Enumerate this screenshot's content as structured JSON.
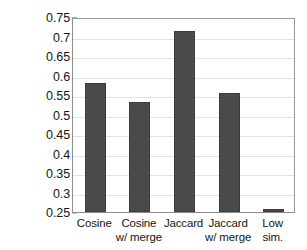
{
  "chart_data": {
    "type": "bar",
    "title": "",
    "xlabel": "",
    "ylabel": "Probability",
    "categories": [
      "Cosine",
      "Cosine\nw/ merge",
      "Jaccard",
      "Jaccard\nw/ merge",
      "Low\nsim."
    ],
    "values": [
      0.581,
      0.532,
      0.714,
      0.556,
      0.257
    ],
    "ylim": [
      0.25,
      0.75
    ],
    "ytick_labels": [
      "0.25",
      "0.3",
      "0.35",
      "0.4",
      "0.45",
      "0.5",
      "0.55",
      "0.6",
      "0.65",
      "0.7",
      "0.75"
    ],
    "ytick_values": [
      0.25,
      0.3,
      0.35,
      0.4,
      0.45,
      0.5,
      0.55,
      0.6,
      0.65,
      0.7,
      0.75
    ],
    "grid": true,
    "legend": null,
    "bar_color": "#4a4a4a",
    "grid_color": "#e3e3e3",
    "axis_color": "#8d8d8d",
    "background": "#ffffff"
  }
}
